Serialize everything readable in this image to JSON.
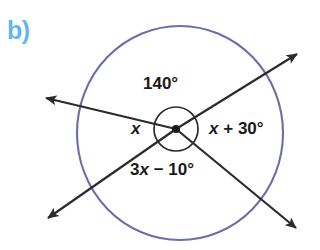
{
  "figure": {
    "part_label": "b)",
    "part_label_color": "#63b8e8",
    "outer_circle_color": "#6b6fa8",
    "line_color": "#2b2b2b",
    "background_color": "#ffffff",
    "center_point": {
      "x": 176,
      "y": 129
    },
    "outer_circle": {
      "cx": 180,
      "cy": 133,
      "rx": 103,
      "ry": 107
    },
    "inner_arc_circle": {
      "cx": 176,
      "cy": 129,
      "r": 22
    },
    "labels": {
      "top_angle": "140°",
      "left_angle": "x",
      "right_angle": "x + 30°",
      "bottom_angle": "3x − 10°"
    },
    "rays": [
      {
        "name": "ray-upper-right",
        "angle_deg": 27,
        "arrowhead": true
      },
      {
        "name": "ray-lower-left",
        "angle_deg": 207,
        "arrowhead": true
      },
      {
        "name": "ray-upper-left",
        "angle_deg": 166,
        "arrowhead": true
      },
      {
        "name": "ray-lower-right",
        "angle_deg": 328,
        "arrowhead": true
      }
    ]
  },
  "chart_data": {
    "type": "diagram",
    "angles": [
      {
        "position": "top",
        "label": "140°",
        "value": 140
      },
      {
        "position": "right",
        "label": "x + 30°",
        "expression": "x + 30"
      },
      {
        "position": "bottom",
        "label": "3x − 10°",
        "expression": "3x - 10"
      },
      {
        "position": "left",
        "label": "x",
        "expression": "x"
      }
    ],
    "sum_constraint_deg": 360
  }
}
